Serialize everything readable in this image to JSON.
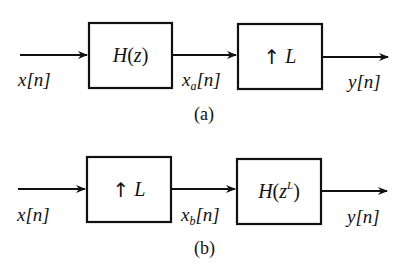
{
  "diagrams": [
    {
      "id": "a",
      "caption": "(a)",
      "input_label": {
        "base": "x",
        "sub": "",
        "arg": "[n]"
      },
      "mid_label": {
        "base": "x",
        "sub": "a",
        "arg": "[n]"
      },
      "output_label": {
        "base": "y",
        "sub": "",
        "arg": "[n]"
      },
      "blocks": [
        {
          "name": "filter",
          "text_main": "H(z)",
          "func": "H",
          "open": "(",
          "var": "z",
          "sup": "",
          "close": ")"
        },
        {
          "name": "upsampler",
          "arrow": "↑",
          "text": "L"
        }
      ]
    },
    {
      "id": "b",
      "caption": "(b)",
      "input_label": {
        "base": "x",
        "sub": "",
        "arg": "[n]"
      },
      "mid_label": {
        "base": "x",
        "sub": "b",
        "arg": "[n]"
      },
      "output_label": {
        "base": "y",
        "sub": "",
        "arg": "[n]"
      },
      "blocks": [
        {
          "name": "upsampler",
          "arrow": "↑",
          "text": "L"
        },
        {
          "name": "filter",
          "text_main": "H(z^L)",
          "func": "H",
          "open": "(",
          "var": "z",
          "sup": "L",
          "close": ")"
        }
      ]
    }
  ],
  "colors": {
    "stroke": "#111111",
    "background": "#ffffff"
  }
}
